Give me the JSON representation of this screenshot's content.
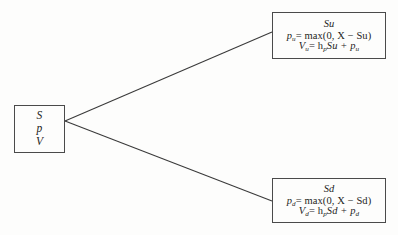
{
  "diagram": {
    "type": "binomial-tree-node",
    "background_color": "#fdfdfc",
    "line_color": "#3a3a3a",
    "border_color": "#4a4a4a",
    "nodes": {
      "root": {
        "name": "root-node",
        "lines": [
          "S",
          "p",
          "V"
        ],
        "line_s": "S",
        "line_p": "p",
        "line_v": "V"
      },
      "up": {
        "name": "up-node",
        "title": "Su",
        "formula_p_lhs": "p",
        "formula_p_sub": "u",
        "formula_p_rhs": "= max(0, X − Su)",
        "formula_v_lhs": "V",
        "formula_v_sub": "u",
        "formula_v_rhs_pre": "= h",
        "formula_v_rhs_sub": "p",
        "formula_v_rhs_post": "Su + p",
        "formula_v_rhs_post_sub": "u",
        "formula_p_plain": "p_u = max(0, X − Su)",
        "formula_v_plain": "V_u = h_p Su + p_u"
      },
      "down": {
        "name": "down-node",
        "title": "Sd",
        "formula_p_lhs": "p",
        "formula_p_sub": "d",
        "formula_p_rhs": "= max(0, X − Sd)",
        "formula_v_lhs": "V",
        "formula_v_sub": "d",
        "formula_v_rhs_pre": "= h",
        "formula_v_rhs_sub": "p",
        "formula_v_rhs_post": "Sd + p",
        "formula_v_rhs_post_sub": "d",
        "formula_p_plain": "p_d = max(0, X − Sd)",
        "formula_v_plain": "V_d = h_p Sd + p_d"
      }
    },
    "edges": [
      {
        "name": "edge-up",
        "from": "root",
        "to": "up",
        "x1": 65,
        "y1": 121,
        "x2": 272,
        "y2": 32
      },
      {
        "name": "edge-down",
        "from": "root",
        "to": "down",
        "x1": 65,
        "y1": 121,
        "x2": 272,
        "y2": 201
      }
    ]
  }
}
